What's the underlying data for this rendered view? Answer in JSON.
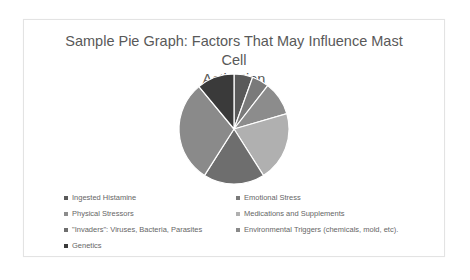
{
  "chart_data": {
    "type": "pie",
    "title": "Sample Pie Graph: Factors That May Influence Mast Cell Activation",
    "title_lines": [
      "Sample Pie Graph: Factors That May Influence Mast Cell",
      "Activation"
    ],
    "categories": [
      "Ingested Histamine",
      "Emotional Stress",
      "Physical Stressors",
      "Medications and Supplements",
      "\"Invaders\": Viruses, Bacteria, Parasites",
      "Environmental Triggers (chemicals, mold, etc).",
      "Genetics"
    ],
    "values": [
      5.5,
      5,
      10,
      20.5,
      18,
      30,
      11
    ],
    "unit": "approx. % of pie (estimated from slice angles; no data labels shown)",
    "start_angle": 0,
    "direction": "clockwise",
    "legend_position": "bottom",
    "colors": [
      "#5a5a5a",
      "#7a7a7a",
      "#8c8c8c",
      "#b0b0b0",
      "#6e6e6e",
      "#8a8a8a",
      "#3a3a3a"
    ]
  },
  "legend": {
    "items": [
      {
        "label": "Ingested Histamine",
        "color": "#5a5a5a"
      },
      {
        "label": "Emotional Stress",
        "color": "#7a7a7a"
      },
      {
        "label": "Physical Stressors",
        "color": "#8c8c8c"
      },
      {
        "label": "Medications and Supplements",
        "color": "#b0b0b0"
      },
      {
        "label": "\"Invaders\": Viruses, Bacteria, Parasites",
        "color": "#6e6e6e"
      },
      {
        "label": "Environmental Triggers (chemicals, mold, etc).",
        "color": "#8a8a8a"
      },
      {
        "label": "Genetics",
        "color": "#3a3a3a"
      }
    ]
  }
}
